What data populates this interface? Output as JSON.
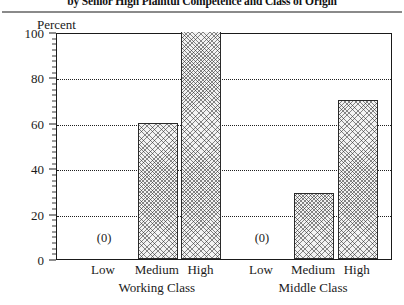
{
  "chart_data": {
    "type": "bar",
    "title": "by Senior High Plaintul Competence and Class of Origin",
    "xlabel": "",
    "ylabel": "Percent",
    "ylim": [
      0,
      100
    ],
    "yticks": [
      0,
      20,
      40,
      60,
      80,
      100
    ],
    "ytick_labels": [
      "0",
      "20",
      "40",
      "60",
      "80",
      "100"
    ],
    "grid": "horizontal-dotted",
    "gridline_values": [
      20,
      40,
      60,
      80
    ],
    "legend": "none",
    "groups": [
      {
        "name": "Working Class",
        "categories": [
          "Low",
          "Medium",
          "High"
        ],
        "values": [
          0,
          60,
          100
        ],
        "value_labels": [
          "(0)",
          "",
          ""
        ]
      },
      {
        "name": "Middle Class",
        "categories": [
          "Low",
          "Medium",
          "High"
        ],
        "values": [
          0,
          29,
          70
        ],
        "value_labels": [
          "(0)",
          "",
          ""
        ]
      }
    ],
    "categories": [
      "Low",
      "Medium",
      "High"
    ],
    "series": [
      {
        "name": "Working Class",
        "values": [
          0,
          60,
          100
        ]
      },
      {
        "name": "Middle Class",
        "values": [
          0,
          29,
          70
        ]
      }
    ],
    "annotations": [
      "(0)",
      "(0)"
    ]
  },
  "axis": {
    "y_title": "Percent"
  },
  "colors": {
    "bar_fill": "#f2f2f2",
    "bar_hatch": "#282828",
    "bar_border": "#2a2a2a",
    "axis": "#1a1a1a",
    "grid": "#1f1f1f",
    "rule": "#8a8a8a"
  }
}
